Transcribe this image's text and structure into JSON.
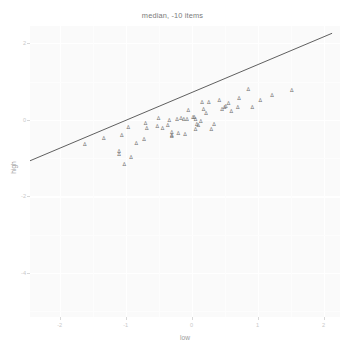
{
  "chart_data": {
    "type": "scatter",
    "title": "median, -10 items",
    "xlabel": "low",
    "ylabel": "high",
    "xlim": [
      -2.45,
      2.25
    ],
    "ylim": [
      -5.15,
      2.45
    ],
    "grid": true,
    "legend": null,
    "marker_glyph": "Δ",
    "x_ticks": [
      {
        "value": -2,
        "label": "-2"
      },
      {
        "value": -1,
        "label": "-1"
      },
      {
        "value": 0,
        "label": "0"
      },
      {
        "value": 1,
        "label": "1"
      },
      {
        "value": 2,
        "label": "2"
      }
    ],
    "y_ticks": [
      {
        "value": 2,
        "label": "2"
      },
      {
        "value": 0,
        "label": "0"
      },
      {
        "value": -2,
        "label": "-2"
      },
      {
        "value": -4,
        "label": "-4"
      }
    ],
    "fit_line": {
      "label": "linear fit",
      "x_start": -2.45,
      "y_start": -1.07,
      "x_end": 2.13,
      "y_end": 2.26,
      "slope": 0.727,
      "intercept": 0.71
    },
    "points": [
      {
        "x": -1.62,
        "y": -0.66
      },
      {
        "x": -1.33,
        "y": -0.49
      },
      {
        "x": -1.1,
        "y": -0.83
      },
      {
        "x": -1.1,
        "y": -0.93
      },
      {
        "x": -1.02,
        "y": -1.17
      },
      {
        "x": -0.96,
        "y": -0.22
      },
      {
        "x": -1.06,
        "y": -0.41
      },
      {
        "x": -0.72,
        "y": -0.54
      },
      {
        "x": -0.68,
        "y": -0.25
      },
      {
        "x": -0.7,
        "y": -0.11
      },
      {
        "x": -0.5,
        "y": 0.02
      },
      {
        "x": -0.52,
        "y": -0.2
      },
      {
        "x": -0.34,
        "y": -0.03
      },
      {
        "x": -0.36,
        "y": -0.16
      },
      {
        "x": -0.3,
        "y": -0.34
      },
      {
        "x": -0.3,
        "y": -0.42
      },
      {
        "x": -0.3,
        "y": -0.45
      },
      {
        "x": -0.2,
        "y": -0.38
      },
      {
        "x": -0.22,
        "y": -0.01
      },
      {
        "x": -0.16,
        "y": 0.02
      },
      {
        "x": -0.12,
        "y": -0.01
      },
      {
        "x": -0.07,
        "y": -0.01
      },
      {
        "x": -0.1,
        "y": -0.4
      },
      {
        "x": -0.05,
        "y": 0.22
      },
      {
        "x": 0.02,
        "y": 0.04
      },
      {
        "x": 0.04,
        "y": 0.06
      },
      {
        "x": 0.06,
        "y": -0.01
      },
      {
        "x": 0.08,
        "y": -0.14
      },
      {
        "x": 0.1,
        "y": -0.16
      },
      {
        "x": 0.06,
        "y": -0.26
      },
      {
        "x": 0.18,
        "y": 0.26
      },
      {
        "x": 0.16,
        "y": 0.44
      },
      {
        "x": 0.22,
        "y": 0.14
      },
      {
        "x": 0.26,
        "y": 0.43
      },
      {
        "x": 0.3,
        "y": -0.26
      },
      {
        "x": 0.42,
        "y": 0.48
      },
      {
        "x": 0.46,
        "y": 0.26
      },
      {
        "x": 0.5,
        "y": 0.3
      },
      {
        "x": 0.52,
        "y": 0.33
      },
      {
        "x": 0.56,
        "y": 0.42
      },
      {
        "x": 0.6,
        "y": 0.2
      },
      {
        "x": 0.7,
        "y": 0.32
      },
      {
        "x": 0.72,
        "y": 0.55
      },
      {
        "x": 0.86,
        "y": 0.79
      },
      {
        "x": 0.92,
        "y": 0.31
      },
      {
        "x": 1.04,
        "y": 0.5
      },
      {
        "x": 1.22,
        "y": 0.61
      },
      {
        "x": 1.52,
        "y": 0.76
      },
      {
        "x": 0.14,
        "y": -0.05
      },
      {
        "x": 0.34,
        "y": -0.14
      },
      {
        "x": -0.84,
        "y": -0.62
      },
      {
        "x": -0.92,
        "y": -0.99
      },
      {
        "x": -0.44,
        "y": -0.23
      }
    ]
  }
}
